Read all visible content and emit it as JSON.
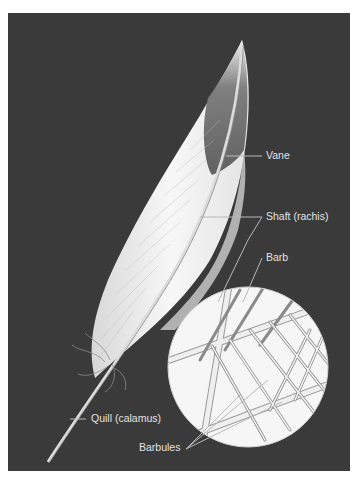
{
  "diagram": {
    "labels": {
      "vane": "Vane",
      "shaft": "Shaft (rachis)",
      "barb": "Barb",
      "quill": "Quill (calamus)",
      "barbules": "Barbules"
    },
    "colors": {
      "background": "#3a3a3a",
      "feather": "#f2f2f2",
      "feather_shadow": "#6a6a6a",
      "label_text": "#e2e2e2",
      "leader_line": "#b8b8b8"
    }
  }
}
